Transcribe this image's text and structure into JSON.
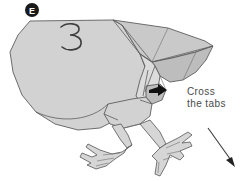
{
  "figure": {
    "kind": "papercraft-folding-instruction-diagram",
    "step_badge": {
      "label": "E",
      "circle_color": "#1a1a1a",
      "text_color": "#ffffff"
    },
    "sheet_marking": {
      "label": "3",
      "style": "handwritten-digit"
    },
    "annotation": {
      "line1": "Cross",
      "line2": "the tabs"
    },
    "icons": {
      "tab_arrow": "black-arrow-icon",
      "direction_arrow": "diagonal-arrow-icon"
    },
    "colors": {
      "paper_main": "#d2d2d2",
      "paper_mid": "#c9c9c9",
      "paper_dark": "#bdbdbd",
      "paper_light": "#dcdcdc",
      "outline": "#5d5d5d",
      "text": "#4a4a4a",
      "background": "#ffffff"
    }
  }
}
